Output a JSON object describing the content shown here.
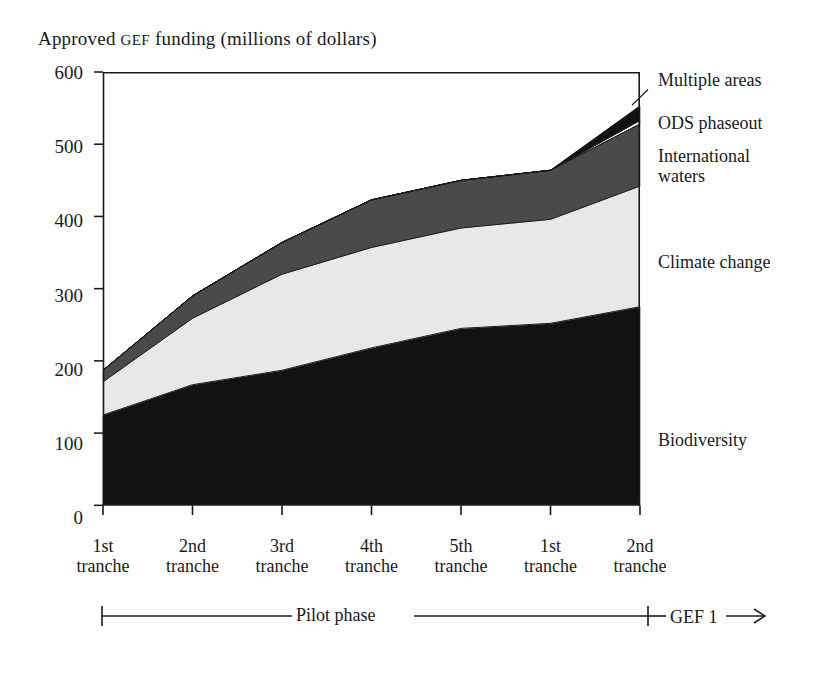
{
  "chart_data": {
    "type": "area",
    "title_prefix": "Approved ",
    "title_smallcaps": "GEF",
    "title_suffix": " funding (millions of dollars)",
    "title": "Approved GEF funding (millions of dollars)",
    "stacked": true,
    "xlabel": "",
    "ylabel": "Approved GEF funding (millions of dollars)",
    "ylim": [
      0,
      600
    ],
    "yticks": [
      0,
      100,
      200,
      300,
      400,
      500,
      600
    ],
    "ytick_labels": [
      "0",
      "100",
      "200",
      "300",
      "400",
      "500",
      "600"
    ],
    "grid": false,
    "legend_position": "right-inline",
    "categories": [
      "1st tranche",
      "2nd tranche",
      "3rd tranche",
      "4th tranche",
      "5th tranche",
      "1st tranche",
      "2nd tranche"
    ],
    "category_lines": [
      [
        "1st",
        "tranche"
      ],
      [
        "2nd",
        "tranche"
      ],
      [
        "3rd",
        "tranche"
      ],
      [
        "4th",
        "tranche"
      ],
      [
        "5th",
        "tranche"
      ],
      [
        "1st",
        "tranche"
      ],
      [
        "2nd",
        "tranche"
      ]
    ],
    "series": [
      {
        "name": "Biodiversity",
        "fill": "#121212",
        "values": [
          125,
          167,
          187,
          218,
          245,
          252,
          275
        ]
      },
      {
        "name": "Climate change",
        "fill": "#e8e8e8",
        "values": [
          46,
          92,
          133,
          139,
          139,
          144,
          167
        ]
      },
      {
        "name": "International waters",
        "fill": "#4a4a4a",
        "values": [
          16,
          31,
          44,
          66,
          66,
          68,
          86
        ]
      },
      {
        "name": "ODS phaseout",
        "fill": "#ffffff",
        "values": [
          0,
          0,
          0,
          0,
          0,
          0,
          5
        ]
      },
      {
        "name": "Multiple areas",
        "fill": "#121212",
        "values": [
          0,
          0,
          0,
          0,
          0,
          0,
          20
        ]
      }
    ],
    "cumulative_totals": [
      187,
      290,
      364,
      423,
      450,
      464,
      553
    ],
    "annotations": [
      {
        "name": "phase-pilot",
        "label": "Pilot phase",
        "span": [
          1,
          5
        ]
      },
      {
        "name": "phase-gef1",
        "label": "GEF 1",
        "span": [
          6,
          7
        ],
        "arrow": "→"
      }
    ]
  },
  "labels": {
    "multiple_areas": "Multiple areas",
    "ods_smallcaps": "ODS",
    "ods_rest": " phaseout",
    "international_waters": "International\nwaters",
    "climate_change": "Climate change",
    "biodiversity": "Biodiversity"
  },
  "phase": {
    "pilot": "Pilot phase",
    "gef_smallcaps": "GEF",
    "gef_number": " 1",
    "arrow": "→"
  },
  "colors": {
    "biodiversity": "#121212",
    "climate_change": "#e8e8e8",
    "international_waters": "#4a4a4a",
    "ods_phaseout": "#ffffff",
    "multiple_areas": "#121212",
    "axis": "#1a1a1a",
    "background": "#ffffff"
  }
}
